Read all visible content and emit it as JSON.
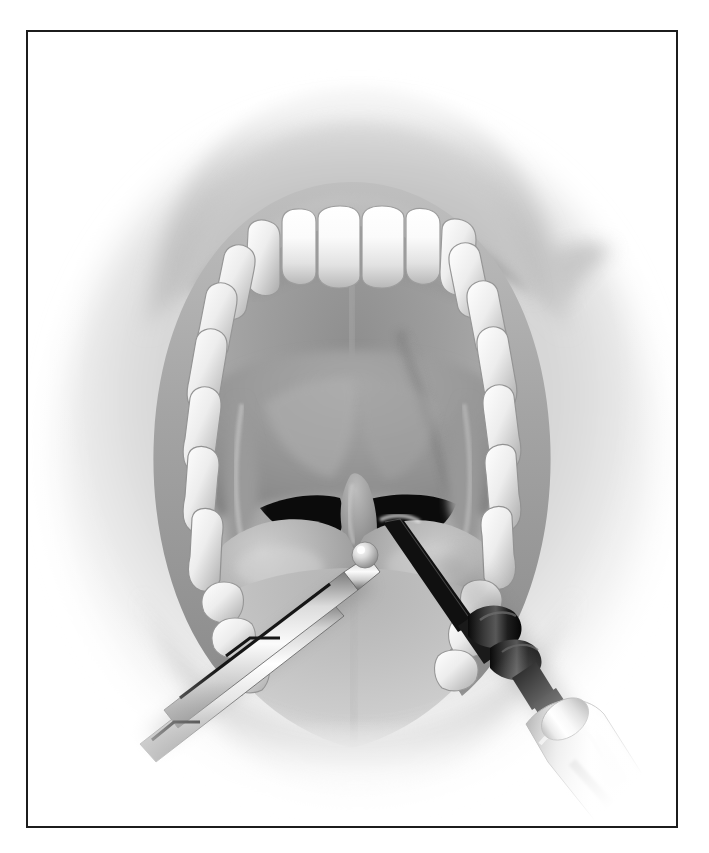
{
  "page": {
    "width": 709,
    "height": 853,
    "background_color": "#ffffff",
    "image_type": "grayscale-airbrush-medical-illustration"
  },
  "figure": {
    "frame": {
      "border_color": "#1c1c1c",
      "border_width_px": 2,
      "x": 26,
      "y": 30,
      "width": 652,
      "height": 798,
      "fill": "#ffffff"
    },
    "title": "Intraoral view of the open mouth during oropharyngeal surgery",
    "caption": "",
    "view": "anterior intraoral view, mouth held open",
    "procedure": "injection / electrocautery at the base of the uvula with the uvula grasped by forceps"
  },
  "anatomy": {
    "parts": [
      {
        "id": "upper-lip",
        "label": "Upper lip",
        "tone": "#b4b4b4"
      },
      {
        "id": "lower-lip",
        "label": "Lower lip",
        "tone": "#c2c2c2"
      },
      {
        "id": "mouth-corner",
        "label": "Left commissure of mouth",
        "tone": "#c8c8c8"
      },
      {
        "id": "upper-teeth",
        "label": "Maxillary dental arch",
        "tone": "#f2f2f2",
        "count": 14
      },
      {
        "id": "lower-teeth",
        "label": "Mandibular teeth",
        "tone": "#ececec",
        "count": 6
      },
      {
        "id": "gingiva",
        "label": "Gingiva",
        "tone": "#b9b9b9"
      },
      {
        "id": "hard-palate",
        "label": "Hard palate",
        "tone": "#a3a3a3"
      },
      {
        "id": "soft-palate",
        "label": "Soft palate",
        "tone": "#9b9b9b"
      },
      {
        "id": "uvula",
        "label": "Uvula",
        "tone": "#8e8e8e"
      },
      {
        "id": "tonsil-left",
        "label": "Left palatine tonsil",
        "tone": "#b0b0b0"
      },
      {
        "id": "tonsil-right",
        "label": "Right palatine tonsil",
        "tone": "#aeaeae"
      },
      {
        "id": "anterior-pillar-left",
        "label": "Left palatoglossal arch",
        "tone": "#9a9a9a"
      },
      {
        "id": "anterior-pillar-right",
        "label": "Right palatoglossal arch",
        "tone": "#989898"
      },
      {
        "id": "oropharynx-left",
        "label": "Left pharyngeal shadow",
        "tone": "#0d0d0d"
      },
      {
        "id": "oropharynx-right",
        "label": "Right pharyngeal shadow",
        "tone": "#0d0d0d"
      },
      {
        "id": "tongue",
        "label": "Dorsum of tongue",
        "tone": "#c6c6c6"
      },
      {
        "id": "buccal-mucosa",
        "label": "Buccal mucosa",
        "tone": "#b6b6b6"
      }
    ]
  },
  "instruments": [
    {
      "id": "forceps",
      "label": "Grasping forceps",
      "side": "left",
      "description": "Long straight two-shank forceps entering from the lower-left, ball-tipped jaw grasping the uvula",
      "metal_highlight": "#fbfbfb",
      "metal_shadow": "#6a6a6a",
      "angle_deg": -33
    },
    {
      "id": "needle-handpiece",
      "label": "Needle electrocautery handpiece",
      "side": "right",
      "description": "Light handpiece entering from the lower-right with dark collar segments and a fine needle tip contacting the base of the uvula",
      "handle_highlight": "#ffffff",
      "handle_shadow": "#8f8f8f",
      "collar_color": "#151515",
      "needle_color": "#111111",
      "angle_deg": 36
    }
  ],
  "palette": {
    "paper": "#ffffff",
    "frame_stroke": "#1c1c1c",
    "tooth_light": "#fdfdfd",
    "tooth_mid": "#d9d9d9",
    "tooth_shadow": "#9d9d9d",
    "lip_light": "#d6d6d6",
    "lip_mid": "#a8a8a8",
    "lip_dark": "#7b7b7b",
    "mucosa_light": "#c9c9c9",
    "mucosa_mid": "#a5a5a5",
    "mucosa_dark": "#787878",
    "cavity_black": "#0b0b0b",
    "metal_light": "#fafafa",
    "metal_dark": "#5e5e5e"
  },
  "accessibility": {
    "alt_text": "Grayscale medical illustration of an open mouth seen from the front. The maxillary teeth arch across the top, the hard and soft palate and the uvula are at the centre, the palatine tonsils bulge on either side and the tongue fills the lower half. A forceps enters from the lower left and grasps the uvula while a needle electrocautery handpiece enters from the lower right and touches the base of the uvula."
  }
}
